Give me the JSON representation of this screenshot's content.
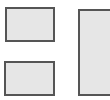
{
  "diagram": {
    "colors": {
      "background": "#ffffff",
      "box_fill": "#e6e6e6",
      "box_border": "#555555"
    },
    "boxes": [
      {
        "id": "box-a",
        "label": ""
      },
      {
        "id": "box-b",
        "label": ""
      },
      {
        "id": "box-c",
        "label": ""
      }
    ]
  }
}
